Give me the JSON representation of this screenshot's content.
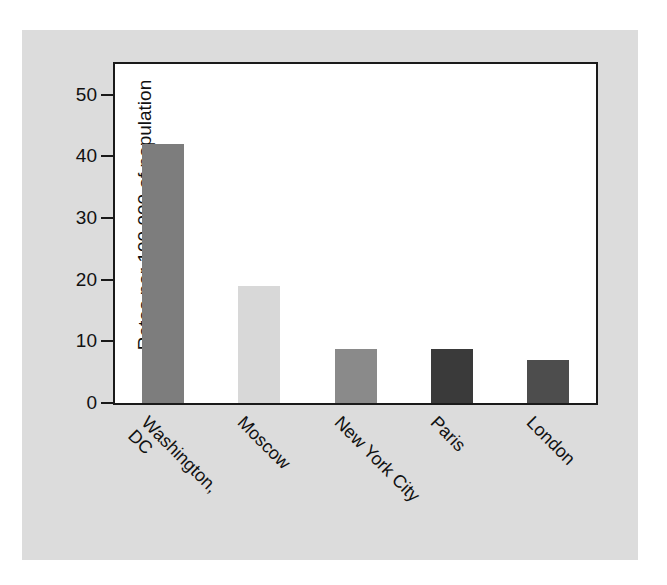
{
  "chart_data": {
    "type": "bar",
    "title": "",
    "xlabel": "",
    "ylabel": "Rates per 100,000 of population",
    "ylim": [
      0,
      55
    ],
    "ytick_values": [
      0,
      10,
      20,
      30,
      40,
      50
    ],
    "ytick_labels": [
      "0",
      "10",
      "20",
      "30",
      "40",
      "50"
    ],
    "grid": false,
    "legend": "none",
    "categories": [
      "Washington, DC",
      "Moscow",
      "New York City",
      "Paris",
      "London"
    ],
    "values": [
      42,
      19,
      8.7,
      8.8,
      7
    ],
    "bar_colors": [
      "#7d7d7d",
      "#d8d8d8",
      "#8a8a8a",
      "#3a3a3a",
      "#4d4d4d"
    ],
    "bars": [
      {
        "label": "Washington, DC",
        "label_lines": [
          "Washington,",
          "DC"
        ],
        "value": 42,
        "color": "#7d7d7d"
      },
      {
        "label": "Moscow",
        "label_lines": [
          "Moscow"
        ],
        "value": 19,
        "color": "#d8d8d8"
      },
      {
        "label": "New York City",
        "label_lines": [
          "New York City"
        ],
        "value": 8.7,
        "color": "#8a8a8a"
      },
      {
        "label": "Paris",
        "label_lines": [
          "Paris"
        ],
        "value": 8.8,
        "color": "#3a3a3a"
      },
      {
        "label": "London",
        "label_lines": [
          "London"
        ],
        "value": 7,
        "color": "#4d4d4d"
      }
    ]
  },
  "colors": {
    "page_background": "#ffffff",
    "figure_background": "#dcdcdc",
    "plot_background": "#ffffff",
    "axis": "#1a1a1a",
    "text": "#111111"
  }
}
